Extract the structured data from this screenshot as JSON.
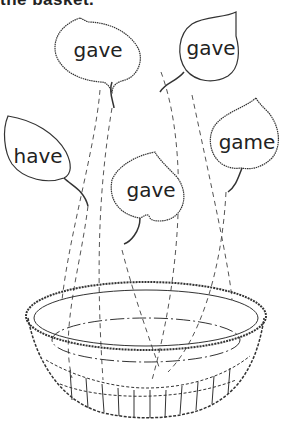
{
  "instruction": "the basket.",
  "leaves": [
    {
      "id": "leaf-1",
      "word": "gave",
      "x": 96,
      "y": 48
    },
    {
      "id": "leaf-2",
      "word": "gave",
      "x": 218,
      "y": 46
    },
    {
      "id": "leaf-3",
      "word": "have",
      "x": 36,
      "y": 155
    },
    {
      "id": "leaf-4",
      "word": "gave",
      "x": 169,
      "y": 194
    },
    {
      "id": "leaf-5",
      "word": "game",
      "x": 253,
      "y": 142
    }
  ],
  "basket": {
    "label": "basket"
  }
}
